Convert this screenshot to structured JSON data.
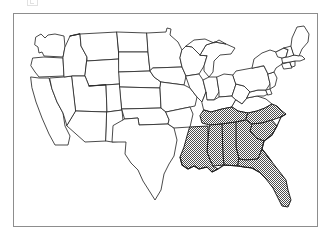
{
  "figure": {
    "type": "choropleth-map",
    "region": "Continental United States",
    "frame": {
      "border_color": "#8d8d8d",
      "background": "#ffffff"
    },
    "legend_present": false,
    "title": "",
    "caption": ""
  },
  "map_data": {
    "projection_extent": {
      "x_min": 0,
      "y_min": 0,
      "x_max": 303,
      "y_max": 212
    },
    "colors": {
      "shaded_fill": "#9a9a9a",
      "unshaded_fill": "#ffffff",
      "border_stroke": "#2b2b2b",
      "frame_stroke": "#8d8d8d"
    },
    "shading_pattern": "dithered-checkerboard-50-percent",
    "shaded_count": 8,
    "unshaded_count": 40,
    "shaded_states": [
      "North Carolina",
      "South Carolina",
      "Georgia",
      "Florida",
      "Alabama",
      "Mississippi",
      "Louisiana",
      "Tennessee"
    ],
    "unshaded_states": [
      "Washington",
      "Oregon",
      "California",
      "Nevada",
      "Idaho",
      "Montana",
      "Wyoming",
      "Utah",
      "Arizona",
      "Colorado",
      "New Mexico",
      "North Dakota",
      "South Dakota",
      "Nebraska",
      "Kansas",
      "Oklahoma",
      "Texas",
      "Minnesota",
      "Iowa",
      "Missouri",
      "Arkansas",
      "Wisconsin",
      "Illinois",
      "Michigan",
      "Indiana",
      "Ohio",
      "Kentucky",
      "West Virginia",
      "Virginia",
      "Maryland",
      "Delaware",
      "Pennsylvania",
      "New Jersey",
      "New York",
      "Connecticut",
      "Rhode Island",
      "Massachusetts",
      "Vermont",
      "New Hampshire",
      "Maine"
    ]
  }
}
